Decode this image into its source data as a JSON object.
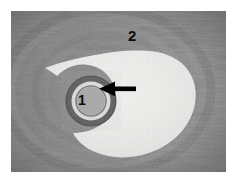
{
  "figure": {
    "kind": "light-microscopy-histology-section",
    "stain_appearance": "grayscale",
    "background_color": "#ffffff",
    "plate": {
      "x": 11,
      "y": 11,
      "width": 215,
      "height": 161,
      "tissue_color": "#8d8d8d",
      "tissue_dark_color": "#5e5e5e",
      "lumen_color": "#f2f2f0"
    },
    "annotations": [
      {
        "name": "label-2",
        "text": "2",
        "color": "#0b0b0b",
        "x": 117,
        "y": 17,
        "points_to": "large irregular pale lumen / cavity"
      },
      {
        "name": "label-1",
        "text": "1",
        "color": "#0b0b0b",
        "x": 67,
        "y": 82,
        "points_to": "concentric ringed round structure"
      },
      {
        "name": "arrow-marker",
        "text": "",
        "color": "#000000",
        "direction": "left",
        "x": 100,
        "y": 88,
        "points_to": "wall of the ringed structure"
      }
    ],
    "caption": ""
  }
}
